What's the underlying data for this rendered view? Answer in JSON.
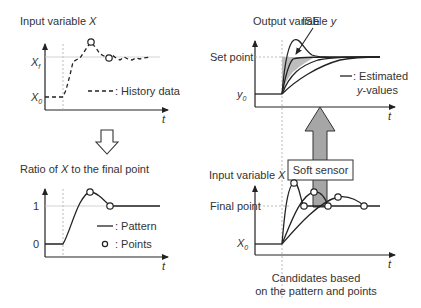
{
  "panels": {
    "history": {
      "title_prefix": "Input variable ",
      "title_var": "X",
      "y_ticks": [
        {
          "label": "X",
          "sub": "f"
        },
        {
          "label": "X",
          "sub": "0"
        }
      ],
      "x_label": "t",
      "legend": ": History data"
    },
    "ratio": {
      "title_prefix": "Ratio of ",
      "title_var": "X",
      "title_suffix": " to the final point",
      "y_ticks": [
        "1",
        "0"
      ],
      "x_label": "t",
      "legend_pattern": ": Pattern",
      "legend_points": ": Points"
    },
    "output": {
      "title_prefix": "Output variable ",
      "title_var": "y",
      "annotation": "ISE",
      "y_ticks": [
        {
          "label": "Set point"
        },
        {
          "label": "y",
          "sub": "0"
        }
      ],
      "x_label": "t",
      "legend_line1": ": Estimated",
      "legend_line2_var": "y",
      "legend_line2_suffix": "-values"
    },
    "candidates": {
      "title_prefix": "Input variable ",
      "title_var": "X",
      "y_ticks": [
        {
          "label": "Final point"
        },
        {
          "label": "X",
          "sub": "0"
        }
      ],
      "x_label": "t",
      "caption_line1": "Candidates based",
      "caption_line2": "on the pattern and points"
    }
  },
  "soft_sensor": {
    "label": "Soft sensor",
    "arrow_color": "#a6a6a6"
  },
  "colors": {
    "ise_fill": "#bdbdbd",
    "line": "#222222"
  }
}
